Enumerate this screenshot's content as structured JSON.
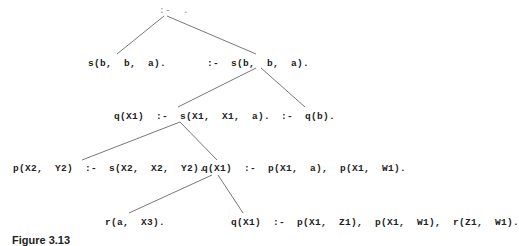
{
  "diagram": {
    "type": "SLD resolution tree",
    "nodes": {
      "root": ":-  .",
      "n1": "s(b,  b,  a).",
      "n2": ":-  s(b,  b,  a).",
      "n3": "q(X1)  :-  s(X1,  X1,  a).",
      "n4": ":-  q(b).",
      "n5": "p(X2,  Y2)  :-  s(X2,  X2,  Y2).",
      "n6": "q(X1)  :-  p(X1,  a),  p(X1,  W1).",
      "n7": "r(a,  X3).",
      "n8": "q(X1)  :-  p(X1,  Z1),  p(X1,  W1),  r(Z1,  W1)."
    },
    "edges": [
      [
        "root",
        "n1"
      ],
      [
        "root",
        "n2"
      ],
      [
        "n2",
        "n3"
      ],
      [
        "n2",
        "n4"
      ],
      [
        "n3",
        "n5"
      ],
      [
        "n3",
        "n6"
      ],
      [
        "n6",
        "n7"
      ],
      [
        "n6",
        "n8"
      ]
    ],
    "caption": "Figure 3.13"
  }
}
